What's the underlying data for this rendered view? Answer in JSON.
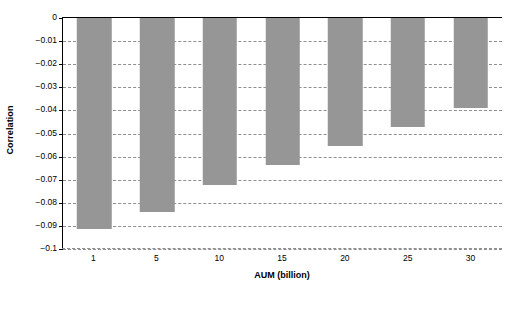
{
  "chart_data": {
    "type": "bar",
    "title": "",
    "subtitle": "",
    "xlabel": "AUM (billion)",
    "ylabel": "Correlation",
    "categories": [
      "1",
      "5",
      "10",
      "15",
      "20",
      "25",
      "30"
    ],
    "values": [
      -0.0913,
      -0.084,
      -0.0725,
      -0.0635,
      -0.0555,
      -0.047,
      -0.039
    ],
    "ylim": [
      -0.1,
      0
    ],
    "xlim": null,
    "ytick_labels": [
      "0",
      "−0.01",
      "−0.02",
      "−0.03",
      "−0.04",
      "−0.05",
      "−0.06",
      "−0.07",
      "−0.08",
      "−0.09",
      "−0.1"
    ],
    "ytick_values": [
      0,
      -0.01,
      -0.02,
      -0.03,
      -0.04,
      -0.05,
      -0.06,
      -0.07,
      -0.08,
      -0.09,
      -0.1
    ],
    "grid": true,
    "grid_style": "dashed",
    "legend": null,
    "legend_position": "none",
    "bar_color": "#969696",
    "grid_color": "#8f8f8f",
    "axis_color": "#000000",
    "background_color": "#ffffff"
  }
}
